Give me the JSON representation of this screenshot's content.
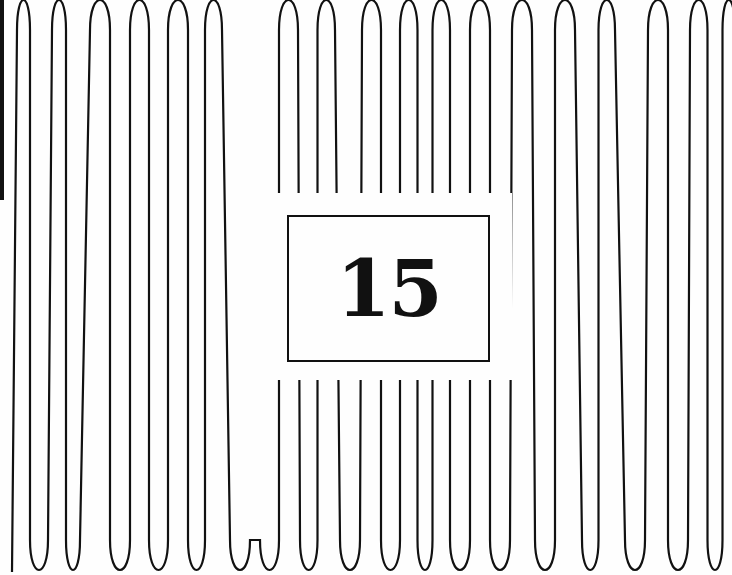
{
  "label": {
    "number": "15"
  },
  "colors": {
    "background": "#fefefe",
    "stroke": "#111111"
  },
  "pattern": {
    "top_turns": [
      22,
      62,
      100,
      140,
      178,
      212,
      288,
      325,
      372,
      410,
      440,
      480,
      522,
      565,
      605,
      658,
      700,
      730
    ],
    "bottom_turns": [
      38,
      70,
      120,
      158,
      198,
      240,
      270,
      310,
      350,
      390,
      425,
      460,
      500,
      545,
      592,
      635,
      678,
      715
    ]
  }
}
